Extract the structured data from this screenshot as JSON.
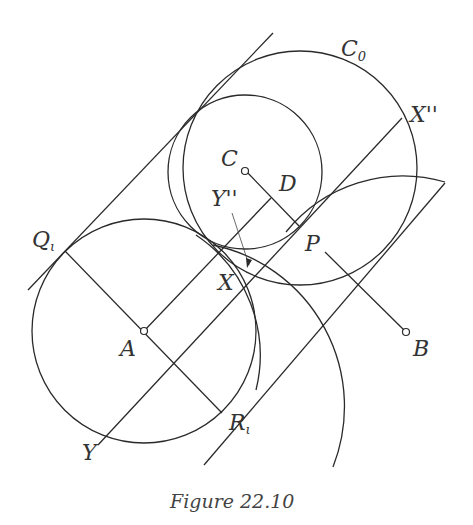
{
  "figure": {
    "caption": "Figure 22.10",
    "labels": {
      "C0_main": "C",
      "C0_sub": "0",
      "C": "C",
      "D": "D",
      "Ypp": "Y''",
      "Xpp": "X''",
      "Q_main": "Q",
      "Q_sub": "ι",
      "P": "P",
      "X": "X",
      "A": "A",
      "B": "B",
      "Y": "Y",
      "R_main": "R",
      "R_sub": "ι"
    },
    "stroke_color": "#2a2a2a",
    "background": "#ffffff"
  }
}
